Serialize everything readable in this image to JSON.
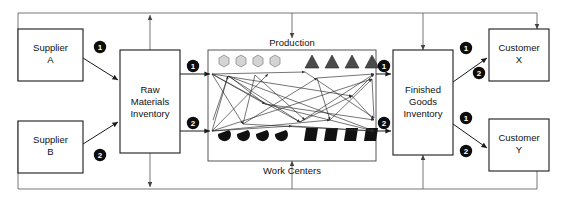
{
  "diagram": {
    "type": "process-flow",
    "nodes": {
      "supplier_a": {
        "line1": "Supplier",
        "line2": "A"
      },
      "supplier_b": {
        "line1": "Supplier",
        "line2": "B"
      },
      "raw_materials": {
        "line1": "Raw",
        "line2": "Materials",
        "line3": "Inventory"
      },
      "finished_goods": {
        "line1": "Finished",
        "line2": "Goods",
        "line3": "Inventory"
      },
      "customer_x": {
        "line1": "Customer",
        "line2": "X"
      },
      "customer_y": {
        "line1": "Customer",
        "line2": "Y"
      }
    },
    "section_labels": {
      "production": "Production",
      "work_centers": "Work Centers"
    },
    "badges": {
      "supplier_a_to_rm": "1",
      "supplier_b_to_rm": "2",
      "rm_to_prod_upper": "1",
      "rm_to_prod_lower": "2",
      "prod_to_fg_upper": "1",
      "prod_to_fg_lower": "2",
      "fg_to_cx_upper": "1",
      "fg_to_cx_lower": "2",
      "fg_to_cy_upper": "1",
      "fg_to_cy_lower": "2"
    },
    "work_center_shapes": {
      "top_left_group": {
        "icon": "hexagon-icon",
        "count": 4,
        "color": "#d4d4d4"
      },
      "top_right_group": {
        "icon": "triangle-icon",
        "count": 4,
        "color": "#4a4a4a"
      },
      "bottom_left_group": {
        "icon": "pacman-icon",
        "count": 4,
        "color": "#111111"
      },
      "bottom_right_group": {
        "icon": "parallelogram-icon",
        "count": 4,
        "color": "#111111"
      }
    },
    "colors": {
      "stroke": "#1a1a1a",
      "loop": "#666666",
      "badge_fill": "#0d0d0d",
      "badge_text": "#ffffff",
      "background": "#ffffff"
    }
  }
}
